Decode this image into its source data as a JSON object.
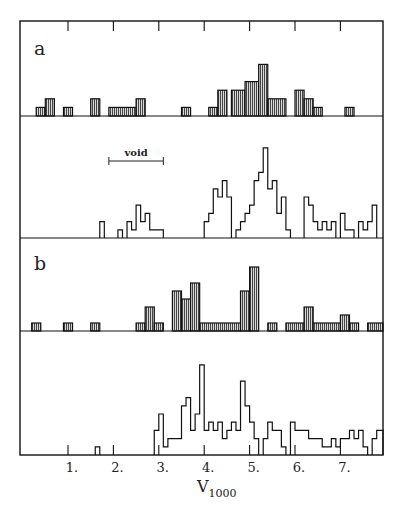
{
  "chart_data": {
    "type": "bar",
    "subtype": "stacked-histogram-panels",
    "xlabel": "V",
    "xlabel_subscript": "1000",
    "xlim": [
      0,
      8
    ],
    "x_ticks": [
      1,
      2,
      3,
      4,
      5,
      6,
      7
    ],
    "x_tick_labels": [
      "1.",
      "2.",
      "3.",
      "4.",
      "5.",
      "6.",
      "7."
    ],
    "grid": false,
    "annotations": [
      {
        "panel": 1,
        "text": "void",
        "x_start": 1.9,
        "x_end": 3.1,
        "type": "range-bracket"
      }
    ],
    "panels": [
      {
        "label": "a",
        "style": "hatched",
        "bins": [
          [
            0.3,
            0.5,
            1
          ],
          [
            0.5,
            0.7,
            2
          ],
          [
            0.9,
            1.1,
            1
          ],
          [
            1.5,
            1.7,
            2
          ],
          [
            1.9,
            2.5,
            1
          ],
          [
            2.5,
            2.7,
            2
          ],
          [
            3.5,
            3.7,
            1
          ],
          [
            4.1,
            4.3,
            1
          ],
          [
            4.3,
            4.5,
            3
          ],
          [
            4.6,
            4.9,
            3
          ],
          [
            4.9,
            5.2,
            4
          ],
          [
            5.2,
            5.4,
            6
          ],
          [
            5.4,
            5.8,
            2
          ],
          [
            6.0,
            6.2,
            3
          ],
          [
            6.2,
            6.4,
            2
          ],
          [
            6.4,
            6.6,
            1
          ],
          [
            7.1,
            7.3,
            1
          ]
        ]
      },
      {
        "label": "",
        "style": "outline",
        "bins": [
          [
            1.7,
            1.8,
            2
          ],
          [
            2.1,
            2.2,
            1
          ],
          [
            2.3,
            2.4,
            2
          ],
          [
            2.4,
            2.5,
            1
          ],
          [
            2.5,
            2.6,
            4
          ],
          [
            2.6,
            2.7,
            2
          ],
          [
            2.7,
            2.8,
            3
          ],
          [
            2.8,
            3.1,
            1
          ],
          [
            4.0,
            4.1,
            2
          ],
          [
            4.1,
            4.2,
            3
          ],
          [
            4.2,
            4.3,
            6
          ],
          [
            4.3,
            4.4,
            5
          ],
          [
            4.4,
            4.5,
            7
          ],
          [
            4.5,
            4.6,
            5
          ],
          [
            4.7,
            4.8,
            1
          ],
          [
            4.8,
            4.9,
            2
          ],
          [
            4.9,
            5.0,
            3
          ],
          [
            5.0,
            5.1,
            4
          ],
          [
            5.1,
            5.2,
            7
          ],
          [
            5.2,
            5.3,
            8
          ],
          [
            5.3,
            5.4,
            11
          ],
          [
            5.4,
            5.5,
            6
          ],
          [
            5.5,
            5.6,
            7
          ],
          [
            5.6,
            5.7,
            3
          ],
          [
            5.7,
            5.8,
            5
          ],
          [
            5.8,
            5.9,
            1
          ],
          [
            6.2,
            6.3,
            5
          ],
          [
            6.3,
            6.4,
            4
          ],
          [
            6.4,
            6.5,
            2
          ],
          [
            6.5,
            6.6,
            1
          ],
          [
            6.6,
            6.7,
            2
          ],
          [
            6.7,
            6.8,
            1
          ],
          [
            6.8,
            6.9,
            2
          ],
          [
            7.0,
            7.1,
            3
          ],
          [
            7.1,
            7.3,
            1
          ],
          [
            7.4,
            7.5,
            2
          ],
          [
            7.5,
            7.6,
            1
          ],
          [
            7.6,
            7.7,
            2
          ],
          [
            7.7,
            7.8,
            4
          ]
        ]
      },
      {
        "label": "b",
        "style": "hatched",
        "bins": [
          [
            0.2,
            0.4,
            1
          ],
          [
            0.9,
            1.1,
            1
          ],
          [
            1.5,
            1.7,
            1
          ],
          [
            2.5,
            2.7,
            1
          ],
          [
            2.7,
            2.9,
            3
          ],
          [
            2.9,
            3.1,
            1
          ],
          [
            3.3,
            3.5,
            5
          ],
          [
            3.5,
            3.7,
            4
          ],
          [
            3.7,
            3.9,
            6
          ],
          [
            3.9,
            4.8,
            1
          ],
          [
            4.8,
            5.0,
            5
          ],
          [
            5.0,
            5.2,
            8
          ],
          [
            5.4,
            5.6,
            1
          ],
          [
            5.8,
            6.2,
            1
          ],
          [
            6.2,
            6.4,
            3
          ],
          [
            6.4,
            7.0,
            1
          ],
          [
            7.0,
            7.2,
            2
          ],
          [
            7.2,
            7.4,
            1
          ],
          [
            7.6,
            8.0,
            1
          ],
          [
            8.0,
            8.2,
            2
          ]
        ]
      },
      {
        "label": "",
        "style": "outline",
        "bins": [
          [
            1.6,
            1.7,
            1
          ],
          [
            2.9,
            3.0,
            3
          ],
          [
            3.0,
            3.1,
            5
          ],
          [
            3.1,
            3.2,
            1
          ],
          [
            3.2,
            3.4,
            2
          ],
          [
            3.4,
            3.5,
            2
          ],
          [
            3.5,
            3.6,
            6
          ],
          [
            3.6,
            3.7,
            7
          ],
          [
            3.7,
            3.8,
            3
          ],
          [
            3.8,
            3.9,
            5
          ],
          [
            3.9,
            4.0,
            11
          ],
          [
            4.0,
            4.1,
            3
          ],
          [
            4.1,
            4.2,
            4
          ],
          [
            4.2,
            4.3,
            3
          ],
          [
            4.3,
            4.4,
            4
          ],
          [
            4.4,
            4.5,
            2
          ],
          [
            4.5,
            4.6,
            3
          ],
          [
            4.6,
            4.7,
            4
          ],
          [
            4.7,
            4.8,
            3
          ],
          [
            4.8,
            4.9,
            9
          ],
          [
            4.9,
            5.0,
            6
          ],
          [
            5.0,
            5.1,
            4
          ],
          [
            5.1,
            5.2,
            2
          ],
          [
            5.3,
            5.4,
            2
          ],
          [
            5.4,
            5.5,
            4
          ],
          [
            5.5,
            5.6,
            3
          ],
          [
            5.6,
            5.7,
            3
          ],
          [
            5.7,
            5.8,
            1
          ],
          [
            5.9,
            6.0,
            4
          ],
          [
            6.0,
            6.1,
            3
          ],
          [
            6.1,
            6.3,
            3
          ],
          [
            6.3,
            6.5,
            2
          ],
          [
            6.5,
            6.6,
            2
          ],
          [
            6.6,
            6.8,
            1
          ],
          [
            6.8,
            6.9,
            2
          ],
          [
            6.9,
            7.0,
            1
          ],
          [
            7.0,
            7.1,
            2
          ],
          [
            7.1,
            7.2,
            2
          ],
          [
            7.2,
            7.3,
            3
          ],
          [
            7.3,
            7.4,
            2
          ],
          [
            7.4,
            7.5,
            3
          ],
          [
            7.5,
            7.6,
            1
          ],
          [
            7.7,
            7.8,
            2
          ],
          [
            7.8,
            8.0,
            3
          ]
        ]
      }
    ]
  }
}
